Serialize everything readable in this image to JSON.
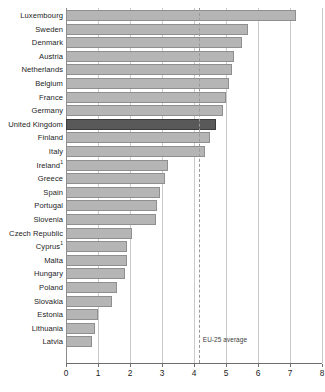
{
  "chart_data": {
    "type": "bar",
    "orientation": "horizontal",
    "title": "",
    "subtitle": "",
    "xlabel": "",
    "ylabel": "",
    "xlim": [
      0,
      8
    ],
    "xticks": [
      0,
      1,
      2,
      3,
      4,
      5,
      6,
      7,
      8
    ],
    "xticklabels": [
      "0",
      "1",
      "2",
      "3",
      "4",
      "5",
      "6",
      "7",
      "8"
    ],
    "grid": "vertical",
    "legend": "none",
    "categories": [
      "Luxembourg",
      "Sweden",
      "Denmark",
      "Austria",
      "Netherlands",
      "Belgium",
      "France",
      "Germany",
      "United Kingdom",
      "Finland",
      "Italy",
      "Ireland",
      "Greece",
      "Spain",
      "Portugal",
      "Slovenia",
      "Czech Republic",
      "Cyprus",
      "Malta",
      "Hungary",
      "Poland",
      "Slovakia",
      "Estonia",
      "Lithuania",
      "Latvia"
    ],
    "category_footnotes": {
      "Ireland": "1",
      "Cyprus": "1"
    },
    "values": [
      7.2,
      5.7,
      5.5,
      5.25,
      5.2,
      5.1,
      5.0,
      4.9,
      4.7,
      4.5,
      4.35,
      3.2,
      3.1,
      2.95,
      2.85,
      2.8,
      2.05,
      1.9,
      1.9,
      1.85,
      1.6,
      1.45,
      1.0,
      0.9,
      0.8
    ],
    "highlight_category": "United Kingdom",
    "annotations": [
      {
        "name": "eu-25-average",
        "label": "EU-25 average",
        "value": 4.15,
        "style": "dashed-vertical-line"
      }
    ],
    "colors": {
      "bar": "#b5b5b5",
      "bar_border": "#8f8f8f",
      "highlight_bar": "#595959",
      "highlight_bar_border": "#3c3c3c",
      "gridline": "#c9c9c9",
      "axis": "#6e6e6e",
      "text": "#1d1d1d",
      "background": "#ffffff"
    }
  }
}
